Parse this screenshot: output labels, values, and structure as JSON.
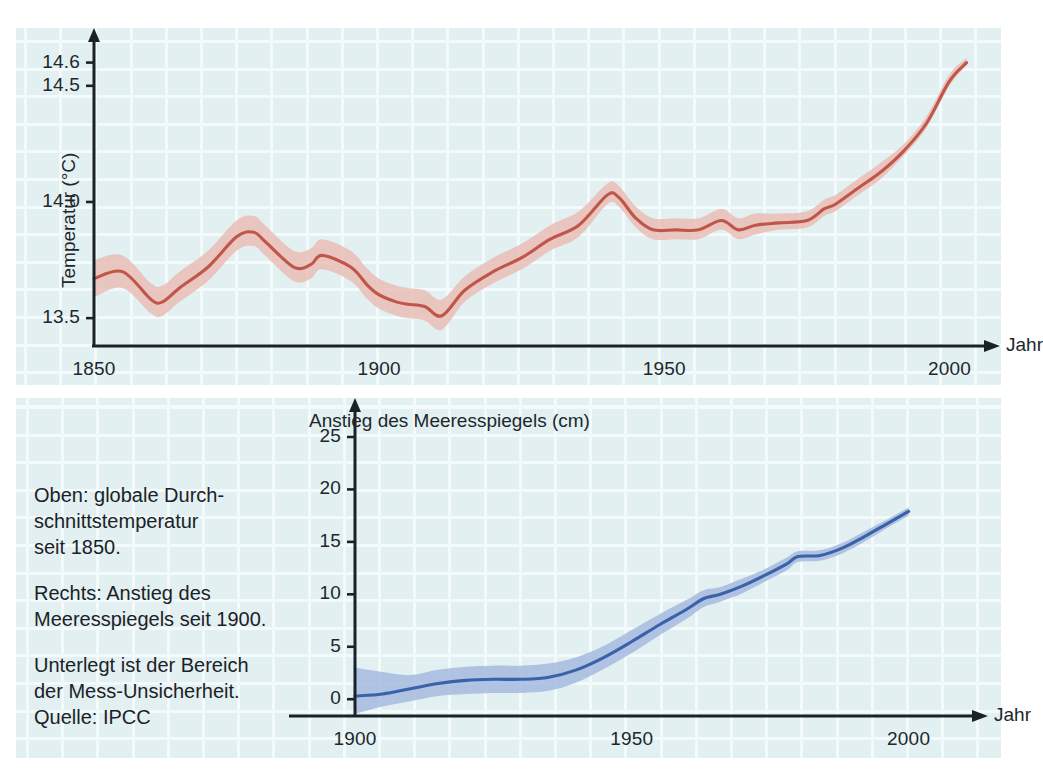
{
  "figure": {
    "background_color": "#ffffff",
    "panel_color": "#e3f0f2",
    "gridline_color": "#f4fbfc",
    "axis_color": "#1b2227"
  },
  "caption": {
    "para1": "Oben: globale Durch-\nschnittstemperatur\nseit 1850.",
    "para2": "Rechts: Anstieg des\nMeeresspiegels seit 1900.",
    "para3": "Unterlegt ist der Bereich\nder Mess-Unsicherheit.\nQuelle: IPCC"
  },
  "chart_data": [
    {
      "id": "temperature",
      "type": "line",
      "title": "",
      "ylabel": "Temperatur (°C)",
      "xlabel": "Jahr",
      "line_color": "#c0564a",
      "band_color": "#e9bdb5",
      "xlim": [
        1850,
        2005
      ],
      "ylim": [
        13.38,
        14.68
      ],
      "xticks": [
        1850,
        1900,
        1950,
        2000
      ],
      "xtick_labels": [
        "1850",
        "1900",
        "1950",
        "2000"
      ],
      "yticks": [
        13.5,
        14.0,
        14.5,
        14.6
      ],
      "ytick_labels": [
        "13.5",
        "14.0",
        "14.5",
        "14.6"
      ],
      "grid": true,
      "x": [
        1850,
        1855,
        1860,
        1862,
        1865,
        1870,
        1875,
        1878,
        1880,
        1885,
        1888,
        1890,
        1895,
        1898,
        1900,
        1903,
        1905,
        1908,
        1911,
        1915,
        1920,
        1925,
        1930,
        1935,
        1940,
        1942,
        1945,
        1948,
        1952,
        1956,
        1960,
        1963,
        1966,
        1970,
        1975,
        1978,
        1980,
        1984,
        1988,
        1992,
        1996,
        2000,
        2003
      ],
      "values": [
        13.67,
        13.7,
        13.58,
        13.57,
        13.63,
        13.72,
        13.85,
        13.87,
        13.83,
        13.72,
        13.73,
        13.77,
        13.72,
        13.64,
        13.6,
        13.57,
        13.56,
        13.55,
        13.51,
        13.62,
        13.7,
        13.76,
        13.84,
        13.9,
        14.03,
        14.02,
        13.93,
        13.88,
        13.88,
        13.88,
        13.92,
        13.88,
        13.9,
        13.91,
        13.92,
        13.97,
        13.99,
        14.06,
        14.13,
        14.22,
        14.34,
        14.52,
        14.6
      ],
      "band_lower": [
        13.59,
        13.63,
        13.52,
        13.51,
        13.57,
        13.66,
        13.79,
        13.81,
        13.77,
        13.66,
        13.67,
        13.71,
        13.66,
        13.58,
        13.54,
        13.51,
        13.5,
        13.49,
        13.45,
        13.57,
        13.65,
        13.71,
        13.79,
        13.85,
        13.99,
        13.98,
        13.89,
        13.84,
        13.84,
        13.84,
        13.88,
        13.84,
        13.86,
        13.88,
        13.89,
        13.94,
        13.96,
        14.03,
        14.1,
        14.2,
        14.32,
        14.5,
        14.59
      ],
      "band_upper": [
        13.75,
        13.77,
        13.65,
        13.64,
        13.7,
        13.79,
        13.92,
        13.94,
        13.9,
        13.79,
        13.8,
        13.84,
        13.79,
        13.71,
        13.67,
        13.64,
        13.63,
        13.62,
        13.58,
        13.68,
        13.76,
        13.82,
        13.9,
        13.96,
        14.08,
        14.07,
        13.98,
        13.93,
        13.93,
        13.93,
        13.97,
        13.93,
        13.95,
        13.95,
        13.96,
        14.01,
        14.03,
        14.1,
        14.17,
        14.25,
        14.37,
        14.55,
        14.62
      ],
      "annotation": "Unterlegt ist der Bereich der Mess-Unsicherheit."
    },
    {
      "id": "sea-level",
      "type": "line",
      "title": "Anstieg des Meeresspiegels (cm)",
      "ylabel": "",
      "xlabel": "Jahr",
      "line_color": "#3a62a8",
      "band_color": "#a6bade",
      "xlim": [
        1900,
        2010
      ],
      "ylim": [
        -1.6,
        27
      ],
      "xticks": [
        1900,
        1950,
        2000
      ],
      "xtick_labels": [
        "1900",
        "1950",
        "2000"
      ],
      "yticks": [
        0,
        5,
        10,
        15,
        20,
        25
      ],
      "ytick_labels": [
        "0",
        "5",
        "10",
        "15",
        "20",
        "25"
      ],
      "grid": true,
      "x": [
        1900,
        1905,
        1910,
        1915,
        1920,
        1925,
        1930,
        1935,
        1940,
        1945,
        1950,
        1955,
        1960,
        1963,
        1966,
        1970,
        1974,
        1978,
        1980,
        1984,
        1988,
        1992,
        1996,
        2000
      ],
      "values": [
        0.3,
        0.5,
        1.0,
        1.5,
        1.8,
        1.9,
        1.9,
        2.1,
        2.8,
        4.0,
        5.5,
        7.1,
        8.6,
        9.6,
        10.0,
        10.8,
        11.8,
        12.9,
        13.6,
        13.7,
        14.4,
        15.5,
        16.7,
        17.9
      ],
      "band_lower": [
        -1.4,
        -0.7,
        -0.2,
        0.3,
        0.5,
        0.6,
        0.6,
        0.8,
        1.6,
        2.9,
        4.4,
        6.1,
        7.7,
        8.8,
        9.3,
        10.1,
        11.2,
        12.3,
        13.1,
        13.2,
        13.9,
        15.0,
        16.3,
        17.5
      ],
      "band_upper": [
        3.0,
        2.6,
        2.3,
        2.8,
        3.1,
        3.2,
        3.2,
        3.4,
        4.0,
        5.1,
        6.6,
        8.1,
        9.5,
        10.4,
        10.7,
        11.5,
        12.4,
        13.5,
        14.1,
        14.2,
        14.9,
        16.0,
        17.1,
        18.3
      ]
    }
  ]
}
